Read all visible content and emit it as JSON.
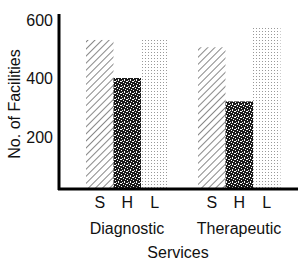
{
  "chart_data": {
    "type": "bar",
    "title": "",
    "xlabel": "Services",
    "ylabel": "No. of Facilities",
    "ylim": [
      0,
      600
    ],
    "yticks": [
      200,
      400,
      600
    ],
    "grid": false,
    "legend": "none (series identified by S / H / L letters under bars)",
    "categories": [
      "Diagnostic",
      "Therapeutic"
    ],
    "series": [
      {
        "name": "S",
        "pattern": "diagonal-hatch",
        "values": [
          530,
          505
        ]
      },
      {
        "name": "H",
        "pattern": "dense-black-speckle",
        "values": [
          400,
          320
        ]
      },
      {
        "name": "L",
        "pattern": "light-dot-grid",
        "values": [
          530,
          575
        ]
      }
    ]
  },
  "labels": {
    "ylabel": "No. of Facilities",
    "xlabel": "Services",
    "yticks": [
      "600",
      "400",
      "200"
    ],
    "categories": [
      "Diagnostic",
      "Therapeutic"
    ],
    "series_letters": [
      "S",
      "H",
      "L"
    ]
  }
}
